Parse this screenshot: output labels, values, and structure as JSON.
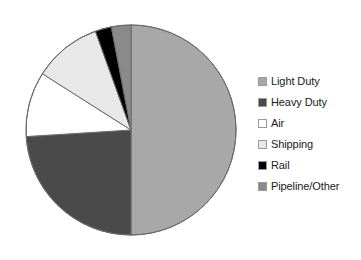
{
  "chart_data": {
    "type": "pie",
    "title": "",
    "subtitle": "",
    "xlabel": "",
    "ylabel": "",
    "grid": false,
    "legend_position": "right",
    "start_angle_deg": 0,
    "direction": "clockwise",
    "categories": [
      "Light Duty",
      "Heavy Duty",
      "Air",
      "Shipping",
      "Rail",
      "Pipeline/Other"
    ],
    "values": [
      50.0,
      24.0,
      10.0,
      10.5,
      2.5,
      3.0
    ],
    "value_unit": "percent",
    "colors": [
      "#a8a8a8",
      "#4a4a4a",
      "#ffffff",
      "#e8e8e8",
      "#000000",
      "#8a8a8a"
    ],
    "slices": [
      {
        "label": "Light Duty",
        "value": 50.0,
        "color": "#a8a8a8",
        "start_deg": 0.0,
        "end_deg": 180.0
      },
      {
        "label": "Heavy Duty",
        "value": 24.0,
        "color": "#4a4a4a",
        "start_deg": 180.0,
        "end_deg": 266.4
      },
      {
        "label": "Air",
        "value": 10.0,
        "color": "#ffffff",
        "start_deg": 266.4,
        "end_deg": 302.4
      },
      {
        "label": "Shipping",
        "value": 10.5,
        "color": "#e8e8e8",
        "start_deg": 302.4,
        "end_deg": 340.2
      },
      {
        "label": "Rail",
        "value": 2.5,
        "color": "#000000",
        "start_deg": 340.2,
        "end_deg": 349.2
      },
      {
        "label": "Pipeline/Other",
        "value": 3.0,
        "color": "#8a8a8a",
        "start_deg": 349.2,
        "end_deg": 360.0
      }
    ]
  },
  "legend": {
    "items": [
      {
        "label": "Light Duty",
        "color": "#a8a8a8",
        "swatch_name": "legend-swatch-light-duty"
      },
      {
        "label": "Heavy Duty",
        "color": "#4a4a4a",
        "swatch_name": "legend-swatch-heavy-duty"
      },
      {
        "label": "Air",
        "color": "#ffffff",
        "swatch_name": "legend-swatch-air"
      },
      {
        "label": "Shipping",
        "color": "#e8e8e8",
        "swatch_name": "legend-swatch-shipping"
      },
      {
        "label": "Rail",
        "color": "#000000",
        "swatch_name": "legend-swatch-rail"
      },
      {
        "label": "Pipeline/Other",
        "color": "#8a8a8a",
        "swatch_name": "legend-swatch-pipeline-other"
      }
    ]
  },
  "geometry": {
    "center_x": 131,
    "center_y": 130,
    "radius": 105,
    "outline_color": "#6a6a6a"
  }
}
